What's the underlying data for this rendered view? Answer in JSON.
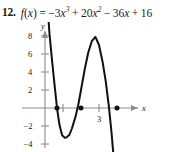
{
  "problem": {
    "number": "12.",
    "function_label": "f(x)",
    "equals": "=",
    "expression": "−3x³ + 20x² − 36x + 16",
    "terms": [
      {
        "sign": "−",
        "coef": "3",
        "var": "x",
        "exp": "3"
      },
      {
        "sign": "+",
        "coef": "20",
        "var": "x",
        "exp": "2"
      },
      {
        "sign": "−",
        "coef": "36",
        "var": "x",
        "exp": ""
      },
      {
        "sign": "+",
        "coef": "16",
        "var": "",
        "exp": ""
      }
    ]
  },
  "chart_data": {
    "type": "line",
    "title": "",
    "xlabel": "x",
    "ylabel": "y",
    "xlim": [
      -0.5,
      5.2
    ],
    "ylim": [
      -5,
      9.5
    ],
    "grid": false,
    "legend": null,
    "function": "f(x) = -3x^3 + 20x^2 - 36x + 16",
    "y_ticks": [
      "8",
      "6",
      "4",
      "2",
      "−2",
      "−4"
    ],
    "y_tick_values": [
      8,
      6,
      4,
      2,
      -2,
      -4
    ],
    "x_ticks": [
      "3"
    ],
    "x_tick_values": [
      1,
      3,
      4
    ],
    "x_tick_labeled": [
      3
    ],
    "marked_points": [
      {
        "x": 0.667,
        "y": 0,
        "label": "root"
      },
      {
        "x": 2,
        "y": 0,
        "label": "root"
      },
      {
        "x": 4,
        "y": 0,
        "label": "root"
      }
    ],
    "local_extrema": [
      {
        "x": 1.18,
        "y": -3.3,
        "type": "local-min"
      },
      {
        "x": 3.37,
        "y": 7.4,
        "type": "local-max"
      }
    ],
    "series": [
      {
        "name": "f(x)",
        "color": "#111111",
        "x": [
          0.1,
          0.25,
          0.4,
          0.55,
          0.667,
          0.8,
          0.95,
          1.1,
          1.18,
          1.35,
          1.5,
          1.7,
          1.85,
          2.0,
          2.2,
          2.4,
          2.6,
          2.8,
          3.0,
          3.2,
          3.37,
          3.55,
          3.7,
          3.85,
          4.0,
          4.15,
          4.3,
          4.45,
          4.6
        ],
        "y": [
          12.6,
          8.24,
          5.11,
          2.21,
          0.0,
          -1.84,
          -3.04,
          -3.3,
          -3.29,
          -3.0,
          -2.25,
          -0.93,
          0.36,
          2.0,
          4.22,
          6.14,
          7.42,
          7.9,
          7.0,
          5.12,
          3.03,
          0.14,
          -2.81,
          -6.36,
          -10.4,
          -14.3,
          -18.1,
          -22.5,
          -27.0
        ]
      }
    ]
  },
  "axes": {
    "y_axis_label": "y",
    "x_axis_label": "x"
  }
}
